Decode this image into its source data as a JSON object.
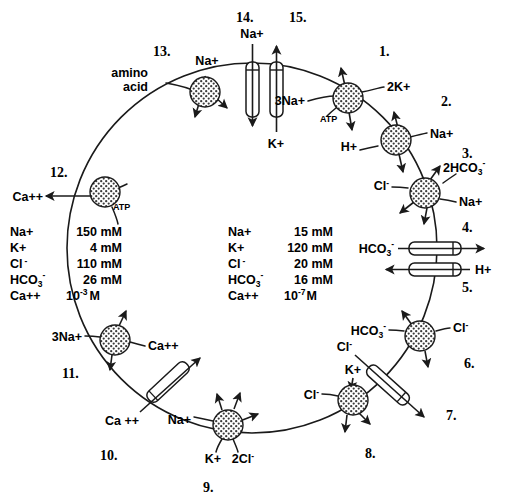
{
  "diagram": {
    "outer_concentrations": {
      "label": "extracellular",
      "rows": [
        {
          "ion": "Na+",
          "value": "150 mM"
        },
        {
          "ion": "K+",
          "value": "4 mM"
        },
        {
          "ion": "Cl -",
          "value": "110 mM"
        },
        {
          "ion": "HCO3-",
          "value": "26 mM"
        },
        {
          "ion": "Ca++",
          "value": "10-3 M"
        }
      ],
      "ion_labels": [
        "Na+",
        "K+",
        "Cl",
        "HCO",
        "Ca++"
      ],
      "values": [
        "150 mM",
        "4 mM",
        "110 mM",
        "26 mM",
        "M"
      ],
      "hco3_sub": "3",
      "hco3_sup": "-",
      "ca_base": "10",
      "ca_exp": "-3",
      "cl_sup": "-"
    },
    "inner_concentrations": {
      "label": "intracellular",
      "rows": [
        {
          "ion": "Na+",
          "value": "15 mM"
        },
        {
          "ion": "K+",
          "value": "120 mM"
        },
        {
          "ion": "Cl -",
          "value": "20 mM"
        },
        {
          "ion": "HCO3-",
          "value": "16 mM"
        },
        {
          "ion": "Ca++",
          "value": "10-7 M"
        }
      ],
      "ion_labels": [
        "Na+",
        "K+",
        "Cl",
        "HCO",
        "Ca++"
      ],
      "values": [
        "15 mM",
        "120 mM",
        "20 mM",
        "16 mM",
        "M"
      ],
      "hco3_sub": "3",
      "hco3_sup": "-",
      "ca_base": "10",
      "ca_exp": "-7",
      "cl_sup": "-"
    },
    "numbers": {
      "n1": "1.",
      "n2": "2.",
      "n3": "3.",
      "n4": "4.",
      "n5": "5.",
      "n6": "6.",
      "n7": "7.",
      "n8": "8.",
      "n9": "9.",
      "n10": "10.",
      "n11": "11.",
      "n12": "12.",
      "n13": "13.",
      "n14": "14.",
      "n15": "15."
    },
    "transporters": [
      {
        "id": 1,
        "name": "sodium-potassium-atpase",
        "kind": "pump",
        "labels": [
          "3Na+",
          "2K+",
          "ATP"
        ]
      },
      {
        "id": 2,
        "name": "sodium-hydrogen-exchanger",
        "kind": "exchanger",
        "labels": [
          "H+",
          "Na+"
        ]
      },
      {
        "id": 3,
        "name": "sodium-bicarbonate-chloride-exchanger",
        "kind": "exchanger",
        "labels": [
          "Cl -",
          "2HCO3-",
          "Na+"
        ]
      },
      {
        "id": 4,
        "name": "bicarbonate-channel",
        "kind": "channel",
        "labels": [
          "HCO3-"
        ]
      },
      {
        "id": 5,
        "name": "hydrogen-channel",
        "kind": "channel",
        "labels": [
          "H+"
        ]
      },
      {
        "id": 6,
        "name": "chloride-bicarbonate-exchanger",
        "kind": "exchanger",
        "labels": [
          "HCO3-",
          "Cl -"
        ]
      },
      {
        "id": 7,
        "name": "chloride-channel",
        "kind": "channel",
        "labels": [
          "Cl -"
        ]
      },
      {
        "id": 8,
        "name": "potassium-chloride-cotransporter",
        "kind": "cotransporter",
        "labels": [
          "Cl -",
          "K+"
        ]
      },
      {
        "id": 9,
        "name": "sodium-potassium-two-chloride-cotransporter",
        "kind": "cotransporter",
        "labels": [
          "Na+",
          "K+",
          "2Cl -"
        ]
      },
      {
        "id": 10,
        "name": "calcium-channel",
        "kind": "channel",
        "labels": [
          "Ca ++"
        ]
      },
      {
        "id": 11,
        "name": "sodium-calcium-exchanger",
        "kind": "exchanger",
        "labels": [
          "3Na+",
          "Ca++"
        ]
      },
      {
        "id": 12,
        "name": "calcium-atpase",
        "kind": "pump",
        "labels": [
          "Ca++",
          "ATP"
        ]
      },
      {
        "id": 13,
        "name": "sodium-amino-acid-cotransporter",
        "kind": "cotransporter",
        "labels": [
          "amino",
          "acid",
          "Na+"
        ]
      },
      {
        "id": 14,
        "name": "sodium-channel",
        "kind": "channel",
        "labels": [
          "Na+"
        ]
      },
      {
        "id": 15,
        "name": "potassium-channel",
        "kind": "channel",
        "labels": [
          "K+"
        ]
      }
    ],
    "species": {
      "na": "Na+",
      "na3": "3Na+",
      "k": "K+",
      "k2": "2K+",
      "cl": "Cl",
      "cl2": "2Cl",
      "ca": "Ca++",
      "ca_sp": "Ca ++",
      "h": "H+",
      "hco3": "HCO",
      "hco3_2": "2HCO",
      "atp": "ATP",
      "amino": "amino",
      "acid": "acid",
      "minus": "-",
      "three": "3"
    }
  }
}
